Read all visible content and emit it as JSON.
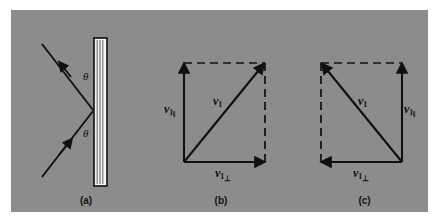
{
  "figure": {
    "background_color": "#ffffff",
    "plate_color": "#8c8c8c",
    "ink_color": "#101010",
    "wall_fill_color": "#f2f2f2"
  },
  "panels": [
    {
      "id": "a",
      "caption": "(a)",
      "description": "ball bouncing off a wall, incoming and outgoing rays at equal angles theta to the wall normal",
      "angle_label_upper": "θ",
      "angle_label_lower": "θ",
      "wall": {
        "name": "wall",
        "orientation": "vertical"
      },
      "rays": [
        {
          "name": "incoming-ray",
          "direction": "up-right"
        },
        {
          "name": "outgoing-ray",
          "direction": "down-left"
        }
      ]
    },
    {
      "id": "b",
      "caption": "(b)",
      "description": "velocity vector v1 before impact resolved into parallel and perpendicular components",
      "labels": {
        "resultant": {
          "symbol": "v",
          "sub": "1",
          "sub2": ""
        },
        "parallel": {
          "symbol": "v",
          "sub": "1",
          "sub2": "‖"
        },
        "perpendicular": {
          "symbol": "v",
          "sub": "1",
          "sub2": "⊥"
        }
      },
      "vectors": [
        {
          "name": "v1-parallel-arrow",
          "side": "left",
          "direction": "up",
          "style": "solid"
        },
        {
          "name": "v1-perpendicular-arrow",
          "side": "bottom",
          "direction": "right",
          "style": "solid"
        },
        {
          "name": "v1-resultant-arrow",
          "side": "diagonal",
          "direction": "up-right",
          "style": "solid"
        },
        {
          "name": "construction-line-top",
          "side": "top",
          "style": "dashed"
        },
        {
          "name": "construction-line-right",
          "side": "right",
          "style": "dashed"
        }
      ]
    },
    {
      "id": "c",
      "caption": "(c)",
      "description": "velocity vector v1 after impact, perpendicular component reversed",
      "labels": {
        "resultant": {
          "symbol": "v",
          "sub": "1",
          "sub2": ""
        },
        "parallel": {
          "symbol": "v",
          "sub": "1",
          "sub2": "‖"
        },
        "perpendicular": {
          "symbol": "v",
          "sub": "1",
          "sub2": "⊥"
        }
      },
      "vectors": [
        {
          "name": "v1-parallel-arrow",
          "side": "right",
          "direction": "up",
          "style": "solid"
        },
        {
          "name": "v1-perpendicular-arrow",
          "side": "bottom",
          "direction": "left",
          "style": "solid"
        },
        {
          "name": "v1-resultant-arrow",
          "side": "diagonal",
          "direction": "up-left",
          "style": "solid"
        },
        {
          "name": "construction-line-top",
          "side": "top",
          "style": "dashed"
        },
        {
          "name": "construction-line-left",
          "side": "left",
          "style": "dashed"
        }
      ]
    }
  ]
}
